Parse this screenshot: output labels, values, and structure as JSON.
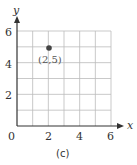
{
  "chart_data": {
    "type": "scatter",
    "title": "",
    "caption": "(c)",
    "xlabel": "x",
    "ylabel": "y",
    "xlim": [
      0,
      6
    ],
    "ylim": [
      0,
      6
    ],
    "grid": true,
    "grid_step": 1,
    "x_ticks": [
      "2",
      "4",
      "6"
    ],
    "y_ticks": [
      "2",
      "4",
      "6"
    ],
    "origin_label": "0",
    "points": [
      {
        "x": 2,
        "y": 5,
        "label": "(2,5)"
      }
    ]
  },
  "colors": {
    "grid": "#bbbbbb",
    "axis": "#333333",
    "point": "#444444"
  }
}
